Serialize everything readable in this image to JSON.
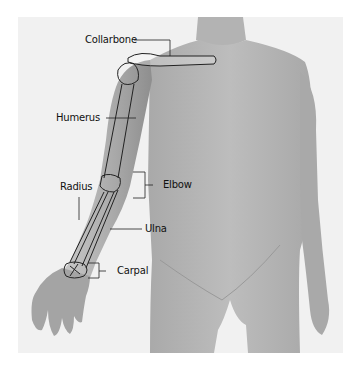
{
  "figure": {
    "labels": [
      {
        "id": "collarbone",
        "text": "Collarbone"
      },
      {
        "id": "humerus",
        "text": "Humerus"
      },
      {
        "id": "radius",
        "text": "Radius"
      },
      {
        "id": "elbow",
        "text": "Elbow"
      },
      {
        "id": "ulna",
        "text": "Ulna"
      },
      {
        "id": "carpal",
        "text": "Carpal"
      }
    ],
    "colors": {
      "background": "#ffffff",
      "panel": "#f1f1f1",
      "skin": "#b9b9b9",
      "skin_shadow": "#9a9a9a",
      "bone_outline": "#222222",
      "label_text": "#111111"
    }
  }
}
